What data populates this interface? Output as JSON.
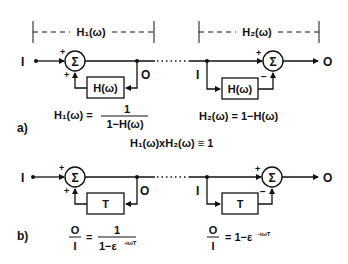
{
  "panel_a": {
    "label": "a)",
    "left": {
      "bracket_label": "H₁(ω)",
      "input": "I",
      "output": "O",
      "sum_symbol": "Σ",
      "sign_top": "+",
      "sign_bottom": "+",
      "block": "H(ω)",
      "eq_lhs": "H₁(ω) =",
      "eq_num": "1",
      "eq_den": "1−H(ω)"
    },
    "right": {
      "bracket_label": "H₂(ω)",
      "input": "I",
      "output": "O",
      "sum_symbol": "Σ",
      "sign_top": "+",
      "sign_bottom": "−",
      "block": "H(ω)",
      "eq": "H₂(ω) = 1−H(ω)"
    },
    "product": "H₁(ω)xH₂(ω)  ≡ 1"
  },
  "panel_b": {
    "label": "b)",
    "left": {
      "input": "I",
      "output": "O",
      "sum_symbol": "Σ",
      "sign_top": "+",
      "sign_bottom": "+",
      "block": "T",
      "eq_lhs_num": "O",
      "eq_lhs_den": "I",
      "eq_eq": "=",
      "eq_num": "1",
      "eq_den_base": "1−ε",
      "eq_den_exp": "-iωT"
    },
    "right": {
      "input": "I",
      "output": "O",
      "sum_symbol": "Σ",
      "sign_top": "+",
      "sign_bottom": "−",
      "block": "T",
      "eq_lhs_num": "O",
      "eq_lhs_den": "I",
      "eq_rhs_base": "= 1−ε",
      "eq_rhs_exp": "-iωT"
    }
  }
}
